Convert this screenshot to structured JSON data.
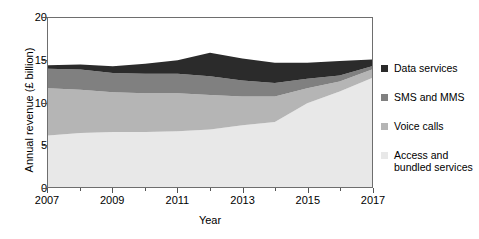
{
  "chart_data": {
    "type": "area",
    "stacked": true,
    "title": "",
    "xlabel": "Year",
    "ylabel": "Annual revenue (£ billion)",
    "x": [
      2007,
      2008,
      2009,
      2010,
      2011,
      2012,
      2013,
      2014,
      2015,
      2016,
      2017
    ],
    "xlim": [
      2007,
      2017
    ],
    "ylim": [
      0,
      20
    ],
    "yticks": [
      0,
      5,
      10,
      15,
      20
    ],
    "xticks": [
      2007,
      2008,
      2009,
      2010,
      2011,
      2012,
      2013,
      2014,
      2015,
      2016,
      2017
    ],
    "xtick_labels": [
      "2007",
      "",
      "2009",
      "",
      "2011",
      "",
      "2013",
      "",
      "2015",
      "",
      "2017"
    ],
    "grid": false,
    "legend_position": "right",
    "series": [
      {
        "name": "Access and bundled services",
        "color": "#e8e8e8",
        "values": [
          6.1,
          6.4,
          6.5,
          6.5,
          6.6,
          6.8,
          7.3,
          7.7,
          9.9,
          11.3,
          12.9
        ]
      },
      {
        "name": "Voice calls",
        "color": "#b5b5b5",
        "values": [
          5.6,
          5.1,
          4.7,
          4.6,
          4.5,
          4.1,
          3.4,
          3.0,
          1.8,
          1.2,
          1.0
        ]
      },
      {
        "name": "SMS and MMS",
        "color": "#808080",
        "values": [
          2.3,
          2.4,
          2.3,
          2.3,
          2.3,
          2.2,
          1.9,
          1.6,
          1.1,
          0.7,
          0.4
        ]
      },
      {
        "name": "Data services",
        "color": "#2b2b2b",
        "values": [
          0.4,
          0.6,
          0.8,
          1.2,
          1.6,
          2.8,
          2.6,
          2.4,
          1.9,
          1.7,
          0.8
        ]
      }
    ],
    "totals": [
      14.4,
      14.5,
      14.3,
      14.6,
      15.0,
      15.9,
      15.2,
      14.7,
      14.7,
      14.9,
      15.1
    ]
  },
  "legend": {
    "items": [
      {
        "label": "Data services",
        "color": "#2b2b2b"
      },
      {
        "label": "SMS and MMS",
        "color": "#808080"
      },
      {
        "label": "Voice calls",
        "color": "#b5b5b5"
      },
      {
        "label": "Access and bundled services",
        "color": "#e8e8e8"
      }
    ]
  }
}
